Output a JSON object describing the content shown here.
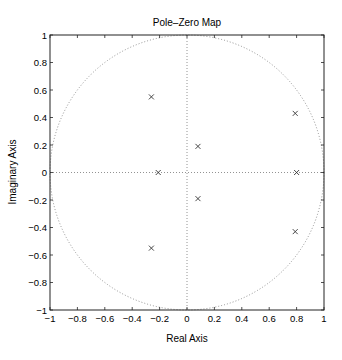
{
  "chart_data": {
    "type": "scatter",
    "title": "Pole–Zero Map",
    "xlabel": "Real Axis",
    "ylabel": "Imaginary Axis",
    "xlim": [
      -1,
      1
    ],
    "ylim": [
      -1,
      1
    ],
    "xticks": [
      -1,
      -0.8,
      -0.6,
      -0.4,
      -0.2,
      0,
      0.2,
      0.4,
      0.6,
      0.8,
      1
    ],
    "yticks": [
      -1,
      -0.8,
      -0.6,
      -0.4,
      -0.2,
      0,
      0.2,
      0.4,
      0.6,
      0.8,
      1
    ],
    "xtick_labels": [
      "−1",
      "−0.8",
      "−0.6",
      "−0.4",
      "−0.2",
      "0",
      "0.2",
      "0.4",
      "0.6",
      "0.8",
      "1"
    ],
    "ytick_labels": [
      "−1",
      "−0.8",
      "−0.6",
      "−0.4",
      "−0.2",
      "0",
      "0.2",
      "0.4",
      "0.6",
      "0.8",
      "1"
    ],
    "grid": false,
    "unit_circle": true,
    "series": [
      {
        "name": "poles",
        "marker": "x",
        "points": [
          {
            "x": -0.26,
            "y": 0.55
          },
          {
            "x": -0.26,
            "y": -0.55
          },
          {
            "x": -0.21,
            "y": 0.0
          },
          {
            "x": 0.08,
            "y": 0.19
          },
          {
            "x": 0.08,
            "y": -0.19
          },
          {
            "x": 0.79,
            "y": 0.43
          },
          {
            "x": 0.79,
            "y": -0.43
          },
          {
            "x": 0.8,
            "y": 0.0
          }
        ]
      }
    ]
  }
}
